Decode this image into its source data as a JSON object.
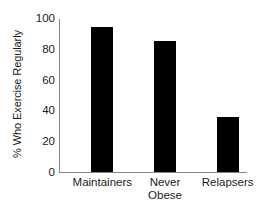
{
  "chart_data": {
    "type": "bar",
    "title": "",
    "xlabel": "",
    "ylabel": "% Who Exercise Regularly",
    "categories": [
      "Maintainers",
      "Never Obese",
      "Relapsers"
    ],
    "category_lines": [
      [
        "Maintainers"
      ],
      [
        "Never",
        "Obese"
      ],
      [
        "Relapsers"
      ]
    ],
    "values": [
      94,
      85,
      36
    ],
    "ylim": [
      0,
      100
    ],
    "yticks": [
      100,
      80,
      60,
      40,
      20,
      0
    ],
    "ytick_labels": [
      "100",
      "80",
      "60",
      "40",
      "20",
      "0"
    ],
    "grid": false,
    "legend": false,
    "bar_color": "#000000",
    "axis_color": "#8a8a8a",
    "background_color": "#ffffff"
  }
}
